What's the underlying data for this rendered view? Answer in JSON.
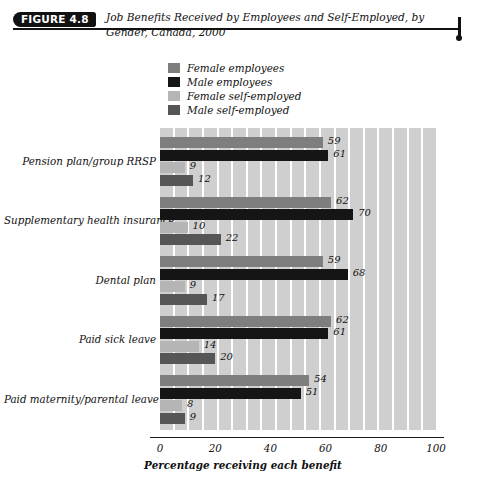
{
  "figure": {
    "badge": "FIGURE 4.8",
    "title": "Job Benefits Received by Employees and Self-Employed, by Gender, Canada, 2000"
  },
  "chart_data": {
    "type": "bar",
    "orientation": "horizontal",
    "title": "Job Benefits Received by Employees and Self-Employed, by Gender, Canada, 2000",
    "xlabel": "Percentage receiving each benefit",
    "ylabel": "",
    "xlim": [
      0,
      100
    ],
    "xticks": [
      0,
      20,
      40,
      60,
      80,
      100
    ],
    "grid": "vertical-stripes",
    "legend_position": "top-center",
    "categories": [
      "Pension plan/group RRSP",
      "Supplementary health insurance",
      "Dental plan",
      "Paid sick leave",
      "Paid maternity/parental leave"
    ],
    "series": [
      {
        "name": "Female employees",
        "color": "#7e7e7e",
        "values": [
          59,
          62,
          59,
          62,
          54
        ]
      },
      {
        "name": "Male employees",
        "color": "#151515",
        "values": [
          61,
          70,
          68,
          61,
          51
        ]
      },
      {
        "name": "Female self-employed",
        "color": "#b5b5b5",
        "values": [
          9,
          10,
          9,
          14,
          8
        ]
      },
      {
        "name": "Male self-employed",
        "color": "#565656",
        "values": [
          12,
          22,
          17,
          20,
          9
        ]
      }
    ]
  },
  "colors": {
    "stripe": "#cfcfcf",
    "axis": "#1a1a1a",
    "badge_bg": "#111111",
    "badge_text": "#ffffff"
  }
}
